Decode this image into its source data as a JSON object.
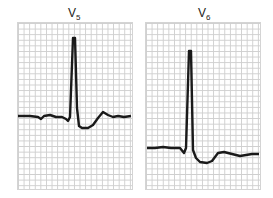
{
  "leads": [
    {
      "name": "V",
      "sub": "5"
    },
    {
      "name": "V",
      "sub": "6"
    }
  ],
  "colors": {
    "trace": "#1a1a1a",
    "grid": "#cfcfcf"
  }
}
